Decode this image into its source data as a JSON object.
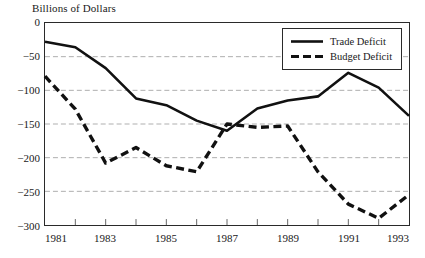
{
  "chart_data": {
    "type": "line",
    "title": "Billions of Dollars",
    "xlabel": "",
    "ylabel": "",
    "ylim": [
      -300,
      0
    ],
    "xlim": [
      1981,
      1993
    ],
    "grid": true,
    "legend_position": "top-right",
    "yticks": [
      "0",
      "-50",
      "-100",
      "-150",
      "-200",
      "-250",
      "-300"
    ],
    "ytick_values": [
      0,
      -50,
      -100,
      -150,
      -200,
      -250,
      -300
    ],
    "xticks": [
      "1981",
      "1983",
      "1985",
      "1987",
      "1989",
      "1991",
      "1993"
    ],
    "xtick_values": [
      1981,
      1983,
      1985,
      1987,
      1989,
      1991,
      1993
    ],
    "x": [
      1981,
      1982,
      1983,
      1984,
      1985,
      1986,
      1987,
      1988,
      1989,
      1990,
      1991,
      1992,
      1993
    ],
    "series": [
      {
        "name": "Trade Deficit",
        "style": "solid",
        "color": "#111111",
        "values": [
          -28,
          -36,
          -67,
          -112,
          -122,
          -145,
          -160,
          -127,
          -115,
          -109,
          -74,
          -96,
          -138
        ]
      },
      {
        "name": "Budget Deficit",
        "style": "dashed",
        "color": "#111111",
        "values": [
          -79,
          -128,
          -208,
          -185,
          -212,
          -221,
          -150,
          -155,
          -153,
          -221,
          -269,
          -290,
          -255
        ]
      }
    ]
  },
  "legend": {
    "items": [
      {
        "label": "Trade Deficit",
        "style": "solid"
      },
      {
        "label": "Budget Deficit",
        "style": "dashed"
      }
    ]
  }
}
